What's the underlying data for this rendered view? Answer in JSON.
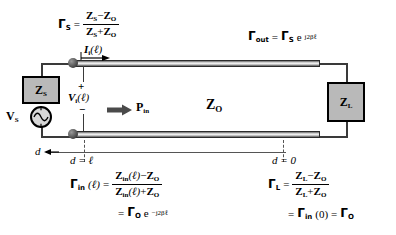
{
  "diagram": {
    "line_impedance_label": "Z",
    "line_impedance_sub": "O",
    "power_label": "P",
    "power_sub": "in",
    "source_box_label": "Z",
    "source_box_sub": "S",
    "source_label": "V",
    "source_sub": "S",
    "load_box_label": "Z",
    "load_box_sub": "L",
    "current_label": "I",
    "current_sub": "i",
    "current_arg": "(ℓ)",
    "voltage_label": "V",
    "voltage_sub": "i",
    "voltage_arg": "(ℓ)",
    "polarity_plus": "+",
    "polarity_minus": "−",
    "axis_direction_label": "d",
    "axis_left_label": "d = ℓ",
    "axis_right_label": "d = 0"
  },
  "equations": {
    "gamma_s": {
      "lhs": "Γ",
      "lhs_sub": "S",
      "eq": "=",
      "num_a": "Z",
      "num_a_sub": "S",
      "num_op": "−",
      "num_b": "Z",
      "num_b_sub": "O",
      "den_a": "Z",
      "den_a_sub": "S",
      "den_op": "+",
      "den_b": "Z",
      "den_b_sub": "O"
    },
    "gamma_out": {
      "lhs": "Γ",
      "lhs_sub": "out",
      "eq": "=",
      "rhs": "Γ",
      "rhs_sub": "S",
      "exp_base": "e",
      "exponent": "j2βℓ"
    },
    "gamma_in": {
      "lhs": "Γ",
      "lhs_sub": "in",
      "lhs_arg": "(ℓ)",
      "eq": "=",
      "num_a": "Z",
      "num_a_sub": "in",
      "num_arg": "(ℓ)",
      "num_op": "−",
      "num_b": "Z",
      "num_b_sub": "O",
      "den_a": "Z",
      "den_a_sub": "in",
      "den_arg": "(ℓ)",
      "den_op": "+",
      "den_b": "Z",
      "den_b_sub": "O",
      "second_eq": "=",
      "second_rhs": "Γ",
      "second_rhs_sub": "O",
      "exp_base": "e",
      "exponent": "−j2βℓ"
    },
    "gamma_l": {
      "lhs": "Γ",
      "lhs_sub": "L",
      "eq": "=",
      "num_a": "Z",
      "num_a_sub": "L",
      "num_op": "−",
      "num_b": "Z",
      "num_b_sub": "O",
      "den_a": "Z",
      "den_a_sub": "L",
      "den_op": "+",
      "den_b": "Z",
      "den_b_sub": "O",
      "second_eq": "=",
      "second_lhs": "Γ",
      "second_lhs_sub": "in",
      "second_arg": "(0)",
      "third_eq": "=",
      "second_rhs": "Γ",
      "second_rhs_sub": "O"
    }
  },
  "colors": {
    "box_fill": "#b9b9b9",
    "wire": "#3a3a3a",
    "text": "#000000",
    "background": "#ffffff"
  }
}
